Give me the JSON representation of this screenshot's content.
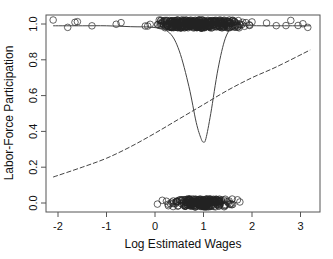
{
  "chart_data": {
    "type": "scatter",
    "title": "",
    "xlabel": "Log Estimated Wages",
    "ylabel": "Labor-Force Participation",
    "xlim": [
      -2.25,
      3.4
    ],
    "ylim": [
      -0.05,
      1.05
    ],
    "xticks": [
      -2,
      -1,
      0,
      1,
      2,
      3
    ],
    "xtick_labels": [
      "-2",
      "-1",
      "0",
      "1",
      "2",
      "3"
    ],
    "yticks": [
      0.0,
      0.2,
      0.4,
      0.6,
      0.8,
      1.0
    ],
    "ytick_labels": [
      "0.0",
      "0.2",
      "0.4",
      "0.6",
      "0.8",
      "1.0"
    ],
    "grid": false,
    "legend": null,
    "series": [
      {
        "name": "observed participation (jittered)",
        "kind": "points",
        "marker": "open-circle",
        "clusters": [
          {
            "y": 1.0,
            "x_range": [
              -2.1,
              3.2
            ],
            "dense_range": [
              0.0,
              1.6
            ]
          },
          {
            "y": 0.0,
            "x_range": [
              0.0,
              1.8
            ],
            "dense_range": [
              0.3,
              1.5
            ]
          }
        ]
      },
      {
        "name": "nonparametric fit",
        "kind": "line",
        "style": "solid",
        "x": [
          -2.1,
          -1.5,
          -1.0,
          -0.5,
          0.0,
          0.3,
          0.5,
          0.7,
          0.85,
          0.95,
          1.0,
          1.05,
          1.15,
          1.3,
          1.45,
          1.6,
          1.8,
          2.2,
          2.6,
          3.2
        ],
        "y": [
          0.99,
          0.99,
          0.99,
          0.985,
          0.98,
          0.95,
          0.85,
          0.65,
          0.45,
          0.36,
          0.34,
          0.36,
          0.5,
          0.75,
          0.92,
          0.98,
          0.99,
          0.99,
          0.99,
          0.99
        ]
      },
      {
        "name": "logistic fit",
        "kind": "line",
        "style": "dashed",
        "x": [
          -2.1,
          -1.5,
          -1.0,
          -0.5,
          0.0,
          0.5,
          1.0,
          1.5,
          2.0,
          2.5,
          3.2
        ],
        "y": [
          0.145,
          0.2,
          0.25,
          0.315,
          0.39,
          0.47,
          0.55,
          0.63,
          0.7,
          0.76,
          0.855
        ]
      }
    ]
  }
}
